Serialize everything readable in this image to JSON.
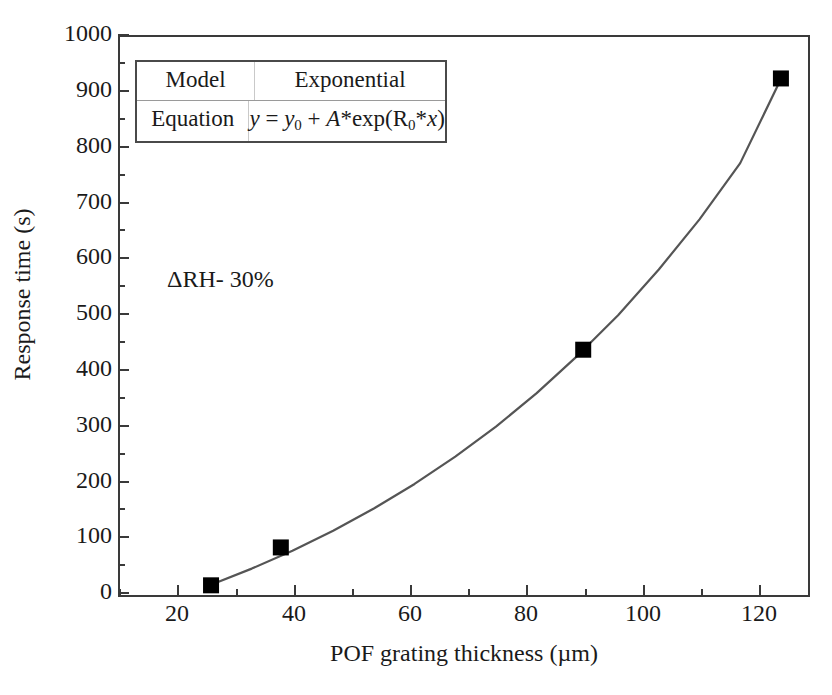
{
  "chart_data": {
    "type": "scatter",
    "title": "",
    "xlabel": "POF grating thickness (µm)",
    "ylabel": "Response time (s)",
    "xlim": [
      10,
      129
    ],
    "ylim": [
      0,
      1000
    ],
    "xticks": [
      20,
      40,
      60,
      80,
      100,
      120
    ],
    "yticks": [
      0,
      100,
      200,
      300,
      400,
      500,
      600,
      700,
      800,
      900,
      1000
    ],
    "xtick_labels": [
      "20",
      "40",
      "60",
      "80",
      "100",
      "120"
    ],
    "ytick_labels": [
      "0",
      "100",
      "200",
      "300",
      "400",
      "500",
      "600",
      "700",
      "800",
      "900",
      "1000"
    ],
    "x_minor_interval": 10,
    "y_minor_interval": 50,
    "grid": false,
    "legend_position": "none",
    "series": [
      {
        "name": "Response time",
        "marker": "filled-square",
        "marker_color": "#000000",
        "x": [
          26,
          38,
          90,
          124
        ],
        "y": [
          12,
          80,
          435,
          922
        ]
      },
      {
        "name": "Exponential fit",
        "type": "line",
        "line_color": "#555555",
        "x": [
          26,
          33,
          40,
          47,
          54,
          61,
          68,
          75,
          82,
          89,
          96,
          103,
          110,
          117,
          124
        ],
        "y": [
          13,
          42,
          74,
          110,
          150,
          194,
          243,
          297,
          357,
          424,
          497,
          579,
          669,
          770,
          921
        ]
      }
    ],
    "annotations": [
      {
        "text": "ΔRH- 30%",
        "x": 36,
        "y": 585
      }
    ]
  },
  "info_table": {
    "rows": [
      {
        "key": "Model",
        "value": "Exponential"
      },
      {
        "key": "Equation",
        "value_parts": {
          "y": "y",
          "eq": " = ",
          "y0": "y",
          "y0sub": "0",
          "plus": " + ",
          "A": "A",
          "star1": "*",
          "exp": "exp(",
          "R": "R",
          "Rsub": "0",
          "star2": "*",
          "x": "x",
          "close": ")"
        }
      }
    ]
  }
}
